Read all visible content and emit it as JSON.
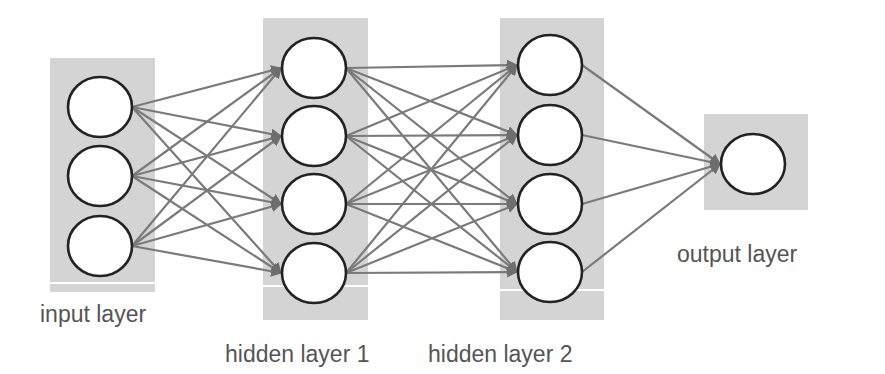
{
  "diagram": {
    "type": "feedforward-neural-network",
    "colors": {
      "layer_box": "#d4d4d4",
      "edge": "#7a7a7a",
      "node_fill": "#ffffff",
      "node_stroke": "#222222",
      "label_text": "#555555"
    },
    "layers": [
      {
        "id": "input",
        "label": "input layer",
        "node_count": 3,
        "box": {
          "x": 50,
          "y": 58,
          "w": 105,
          "h": 234,
          "sep_y": 283
        },
        "nodes": [
          {
            "cx": 100,
            "cy": 107
          },
          {
            "cx": 100,
            "cy": 176
          },
          {
            "cx": 100,
            "cy": 246
          }
        ],
        "label_pos": {
          "x": 40,
          "y": 303
        }
      },
      {
        "id": "hidden1",
        "label": "hidden layer 1",
        "node_count": 4,
        "box": {
          "x": 263,
          "y": 18,
          "w": 105,
          "h": 302,
          "sep_y": 286
        },
        "nodes": [
          {
            "cx": 314,
            "cy": 68
          },
          {
            "cx": 314,
            "cy": 136
          },
          {
            "cx": 314,
            "cy": 204
          },
          {
            "cx": 314,
            "cy": 273
          }
        ],
        "label_pos": {
          "x": 225,
          "y": 343
        }
      },
      {
        "id": "hidden2",
        "label": "hidden layer 2",
        "node_count": 4,
        "box": {
          "x": 500,
          "y": 18,
          "w": 104,
          "h": 302,
          "sep_y": 290
        },
        "nodes": [
          {
            "cx": 550,
            "cy": 65
          },
          {
            "cx": 550,
            "cy": 135
          },
          {
            "cx": 550,
            "cy": 204
          },
          {
            "cx": 550,
            "cy": 272
          }
        ],
        "label_pos": {
          "x": 428,
          "y": 343
        }
      },
      {
        "id": "output",
        "label": "output layer",
        "node_count": 1,
        "box": {
          "x": 704,
          "y": 114,
          "w": 104,
          "h": 96,
          "sep_y": null
        },
        "nodes": [
          {
            "cx": 753,
            "cy": 164
          }
        ],
        "label_pos": {
          "x": 677,
          "y": 243
        }
      }
    ],
    "node_radius": {
      "rx": 32,
      "ry": 30
    },
    "connections": "fully-connected between consecutive layers, directed left-to-right with arrowheads at target nodes"
  }
}
